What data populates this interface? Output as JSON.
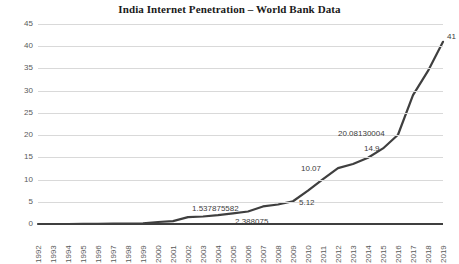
{
  "chart_data": {
    "type": "line",
    "title": "India Internet Penetration – World Bank Data",
    "xlabel": "",
    "ylabel": "",
    "ylim": [
      0,
      45
    ],
    "ytick_step": 5,
    "grid": true,
    "legend": "none",
    "line_color": "#3f3f3f",
    "gridline_color": "#d9d9d9",
    "axis_color": "#3f3f3f",
    "categories": [
      "1992",
      "1993",
      "1994",
      "1995",
      "1996",
      "1997",
      "1998",
      "1999",
      "2000",
      "2001",
      "2002",
      "2003",
      "2004",
      "2005",
      "2006",
      "2007",
      "2008",
      "2009",
      "2010",
      "2011",
      "2012",
      "2013",
      "2014",
      "2015",
      "2016",
      "2017",
      "2018",
      "2019"
    ],
    "yticks": [
      "0",
      "5",
      "10",
      "15",
      "20",
      "25",
      "30",
      "35",
      "40",
      "45"
    ],
    "values": [
      0,
      0,
      0.0,
      0.02,
      0.05,
      0.07,
      0.1,
      0.15,
      0.45,
      0.66,
      1.54,
      1.69,
      1.98,
      2.39,
      2.81,
      3.95,
      4.38,
      5.12,
      7.5,
      10.07,
      12.58,
      13.5,
      14.9,
      17.0,
      20.08,
      29.0,
      34.45,
      41
    ],
    "annotations": [
      {
        "label": "1.537875582",
        "year": "2002",
        "value": 1.537875582
      },
      {
        "label": "2.388075",
        "year": "2005",
        "value": 2.388075
      },
      {
        "label": "5.12",
        "year": "2009",
        "value": 5.12
      },
      {
        "label": "10.07",
        "year": "2011",
        "value": 10.07
      },
      {
        "label": "14.9",
        "year": "2014",
        "value": 14.9
      },
      {
        "label": "20.08130004",
        "year": "2016",
        "value": 20.08130004
      },
      {
        "label": "41",
        "year": "2019",
        "value": 41
      }
    ]
  }
}
